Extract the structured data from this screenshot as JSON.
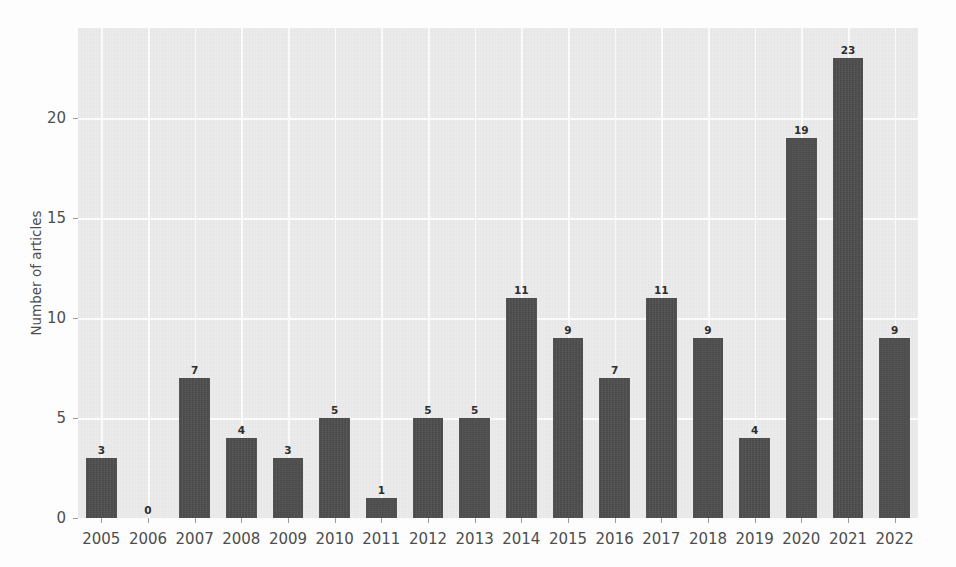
{
  "figure": {
    "background_color": "#fdfdfd",
    "plot_background_color": "#ececec",
    "bar_color": "#4d4d4d",
    "grid_color": "#ffffff",
    "tick_color": "#9a9a9a",
    "text_color": "#4d4d4d"
  },
  "ghost_text": "Number of case studies identified by year\nof publication from the systematic review",
  "chart_data": {
    "type": "bar",
    "title": "",
    "xlabel": "",
    "ylabel": "Number of articles",
    "categories": [
      "2005",
      "2006",
      "2007",
      "2008",
      "2009",
      "2010",
      "2011",
      "2012",
      "2013",
      "2014",
      "2015",
      "2016",
      "2017",
      "2018",
      "2019",
      "2020",
      "2021",
      "2022"
    ],
    "values": [
      3,
      0,
      7,
      4,
      3,
      5,
      1,
      5,
      5,
      11,
      9,
      7,
      11,
      9,
      4,
      19,
      23,
      9
    ],
    "value_labels": [
      "3",
      "0",
      "7",
      "4",
      "3",
      "5",
      "1",
      "5",
      "5",
      "11",
      "9",
      "7",
      "11",
      "9",
      "4",
      "19",
      "23",
      "9"
    ],
    "ylim": [
      0,
      24.5
    ],
    "yticks": [
      0,
      5,
      10,
      15,
      20
    ],
    "ytick_labels": [
      "0",
      "5",
      "10",
      "15",
      "20"
    ],
    "grid": true,
    "grid_axis": "both",
    "legend": null,
    "legend_position": "none",
    "bar_label_position": "above"
  }
}
